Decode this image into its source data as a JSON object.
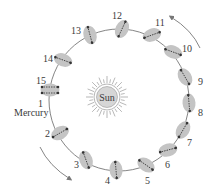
{
  "sun_label": "Sun",
  "planet_label": "Mercury",
  "colors": {
    "orbit": "#666666",
    "planet": "#c4c4c4",
    "arrow": "#333333",
    "sun_fill": "#d6d6d6",
    "text": "#3a3a3a"
  },
  "positions": [
    {
      "n": "1",
      "x": 50,
      "y": 90,
      "angle": 0,
      "lx": 38,
      "ly": 107
    },
    {
      "n": "2",
      "x": 60,
      "y": 133,
      "angle": -30,
      "lx": 45,
      "ly": 137
    },
    {
      "n": "3",
      "x": 86,
      "y": 160,
      "angle": 70,
      "lx": 74,
      "ly": 168
    },
    {
      "n": "4",
      "x": 116,
      "y": 170,
      "angle": 85,
      "lx": 105,
      "ly": 184
    },
    {
      "n": "5",
      "x": 146,
      "y": 165,
      "angle": 35,
      "lx": 145,
      "ly": 184
    },
    {
      "n": "6",
      "x": 168,
      "y": 150,
      "angle": -15,
      "lx": 165,
      "ly": 168
    },
    {
      "n": "7",
      "x": 183,
      "y": 130,
      "angle": -60,
      "lx": 187,
      "ly": 146
    },
    {
      "n": "8",
      "x": 189,
      "y": 103,
      "angle": -95,
      "lx": 198,
      "ly": 116
    },
    {
      "n": "9",
      "x": 185,
      "y": 77,
      "angle": -120,
      "lx": 198,
      "ly": 85
    },
    {
      "n": "10",
      "x": 173,
      "y": 52,
      "angle": -160,
      "lx": 182,
      "ly": 52
    },
    {
      "n": "11",
      "x": 152,
      "y": 35,
      "angle": 160,
      "lx": 155,
      "ly": 26
    },
    {
      "n": "12",
      "x": 122,
      "y": 29,
      "angle": 115,
      "lx": 112,
      "ly": 19
    },
    {
      "n": "13",
      "x": 90,
      "y": 35,
      "angle": 75,
      "lx": 71,
      "ly": 34
    },
    {
      "n": "14",
      "x": 63,
      "y": 60,
      "angle": 20,
      "lx": 43,
      "ly": 62
    },
    {
      "n": "15",
      "x": 50,
      "y": 90,
      "angle": 0,
      "lx": 36,
      "ly": 84
    }
  ]
}
